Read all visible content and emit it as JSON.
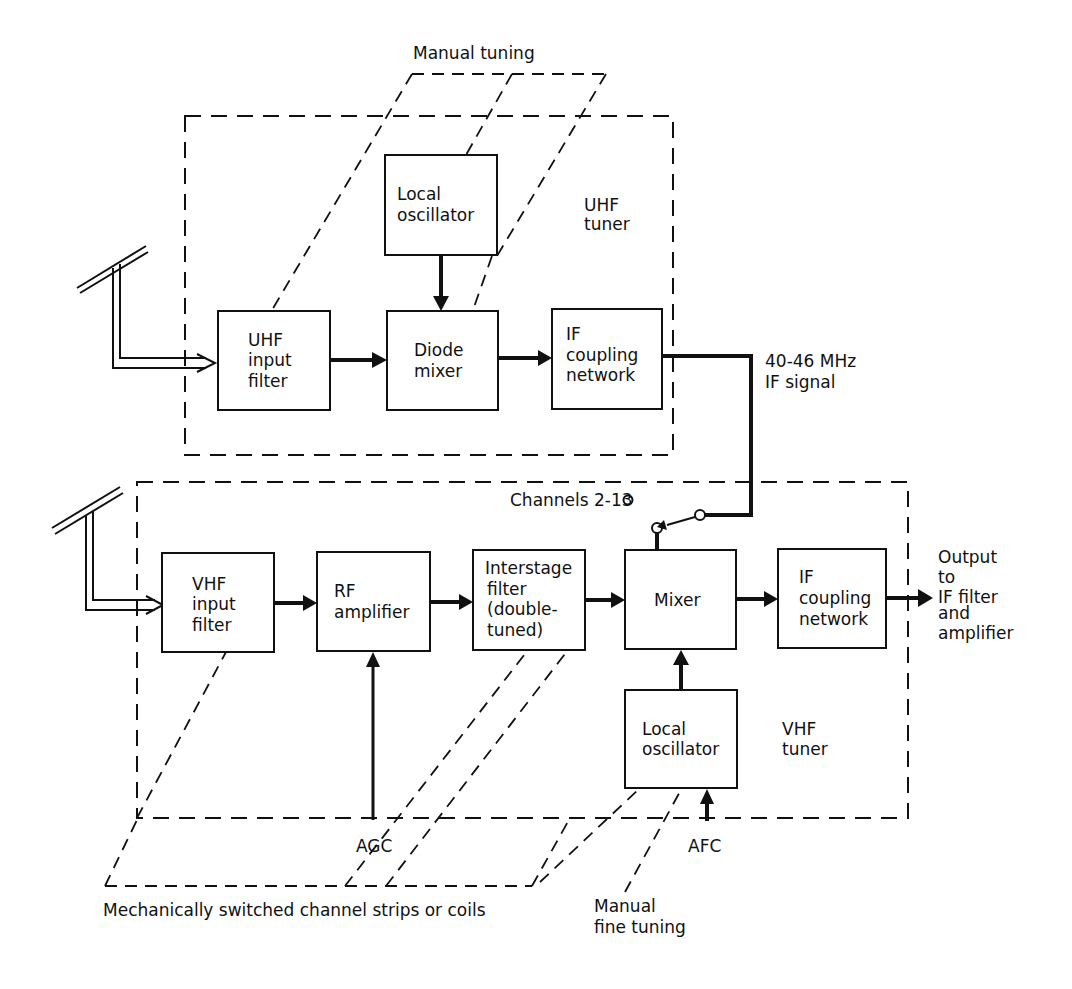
{
  "diagram": {
    "type": "block-diagram",
    "colors": {
      "ink": "#111111",
      "background": "#ffffff"
    },
    "uhf_tuner": {
      "label_line1": "UHF",
      "label_line2": "tuner",
      "blocks": {
        "input_filter": [
          "UHF",
          "input",
          "filter"
        ],
        "diode_mixer": [
          "Diode",
          "mixer"
        ],
        "if_coupling": [
          "IF",
          "coupling",
          "network"
        ],
        "local_oscillator": [
          "Local",
          "oscillator"
        ]
      }
    },
    "vhf_tuner": {
      "label_line1": "VHF",
      "label_line2": "tuner",
      "blocks": {
        "input_filter": [
          "VHF",
          "input",
          "filter"
        ],
        "rf_amplifier": [
          "RF",
          "amplifier"
        ],
        "interstage_filter": [
          "Interstage",
          "filter",
          "(double-",
          "tuned)"
        ],
        "mixer": [
          "Mixer"
        ],
        "if_coupling": [
          "IF",
          "coupling",
          "network"
        ],
        "local_oscillator": [
          "Local",
          "oscillator"
        ]
      }
    },
    "annotations": {
      "manual_tuning": "Manual tuning",
      "if_signal_line1": "40-46 MHz",
      "if_signal_line2": "IF signal",
      "channels": "Channels 2-13",
      "output_line1": "Output",
      "output_line2": "to",
      "output_line3": "IF filter",
      "output_line4": "and",
      "output_line5": "amplifier",
      "agc": "AGC",
      "afc": "AFC",
      "channel_strips": "Mechanically switched channel strips or coils",
      "fine_tuning_line1": "Manual",
      "fine_tuning_line2": "fine tuning"
    }
  }
}
